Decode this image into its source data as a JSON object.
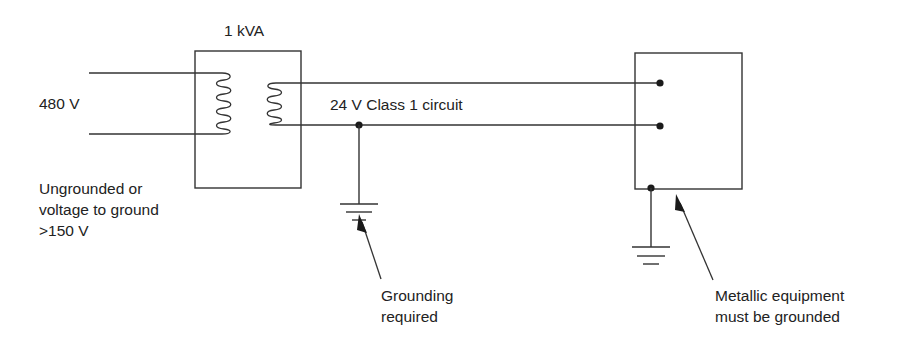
{
  "diagram": {
    "transformer": {
      "rating_label": "1 kVA",
      "primary_voltage_label": "480 V",
      "primary_note_lines": [
        "Ungrounded or",
        "voltage to ground",
        ">150 V"
      ]
    },
    "circuit": {
      "label": "24 V Class 1 circuit"
    },
    "annotations": {
      "grounding_required_lines": [
        "Grounding",
        "required"
      ],
      "equipment_note_lines": [
        "Metallic equipment",
        "must be grounded"
      ]
    },
    "colors": {
      "line": "#333333",
      "text": "#222222",
      "background": "#ffffff"
    },
    "icons": {
      "ground_symbol": "ground-icon",
      "transformer_coil": "inductor-coil-icon",
      "terminal": "terminal-dot-icon",
      "pointer": "arrow-icon"
    }
  }
}
